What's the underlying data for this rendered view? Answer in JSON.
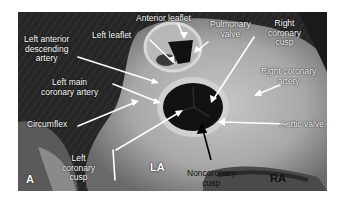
{
  "figure": {
    "panel_label": "A",
    "labels": {
      "anterior_leaflet": "Anterior leaflet",
      "left_leaflet": "Left leaflet",
      "pulmonary_valve": "Pulmonary valve",
      "right_coronary_cusp": "Right coronary cusp",
      "left_anterior_descending_artery": "Left anterior descending artery",
      "right_coronary_artery": "Right coronary artery",
      "left_main_coronary_artery": "Left main coronary artery",
      "circumflex": "Circumflex",
      "aortic_valve": "Aortic valve",
      "left_coronary_cusp": "Left coronary cusp",
      "la": "LA",
      "noncoronary_cusp": "Noncoronary cusp",
      "ra": "RA"
    },
    "label_lines": {
      "anterior_leaflet": [
        "Anterior leaflet"
      ],
      "left_leaflet": [
        "Left leaflet"
      ],
      "pulmonary_valve": [
        "Pulmonary",
        "valve"
      ],
      "right_coronary_cusp": [
        "Right",
        "coronary",
        "cusp"
      ],
      "left_anterior_descending_artery": [
        "Left anterior",
        "descending",
        "artery"
      ],
      "right_coronary_artery": [
        "Right coronary",
        "artery"
      ],
      "left_main_coronary_artery": [
        "Left main",
        "coronary artery"
      ],
      "circumflex": [
        "Circumflex"
      ],
      "aortic_valve": [
        "Aortic valve"
      ],
      "left_coronary_cusp": [
        "Left",
        "coronary",
        "cusp"
      ],
      "noncoronary_cusp": [
        "Noncoronary",
        "cusp"
      ]
    }
  }
}
